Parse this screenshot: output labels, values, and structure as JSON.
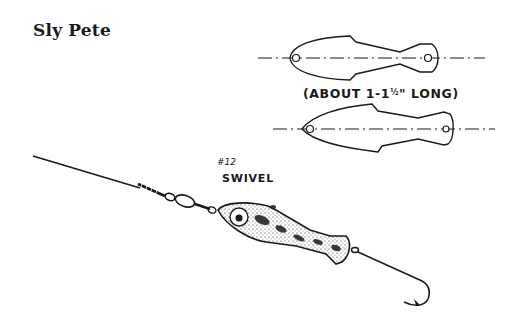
{
  "title": "Sly Pete",
  "labels": {
    "dimension_prefix": "(ABOUT 1-1",
    "dimension_fraction": "½",
    "dimension_suffix": "\" LONG)",
    "swivel_number": "#12",
    "swivel_text": "SWIVEL"
  },
  "figures": [
    {
      "name": "top-template-outline",
      "description": "Fish-shaped lure template outline with centerline and two eye holes (head left)"
    },
    {
      "name": "bottom-template-outline",
      "description": "Second fish-shaped lure template outline with centerline and two eye holes"
    },
    {
      "name": "assembled-lure",
      "description": "Stippled fish-shaped lure on wire with #12 swivel, line, and hook"
    }
  ],
  "colors": {
    "ink": "#1a1a1a",
    "background": "#ffffff"
  }
}
